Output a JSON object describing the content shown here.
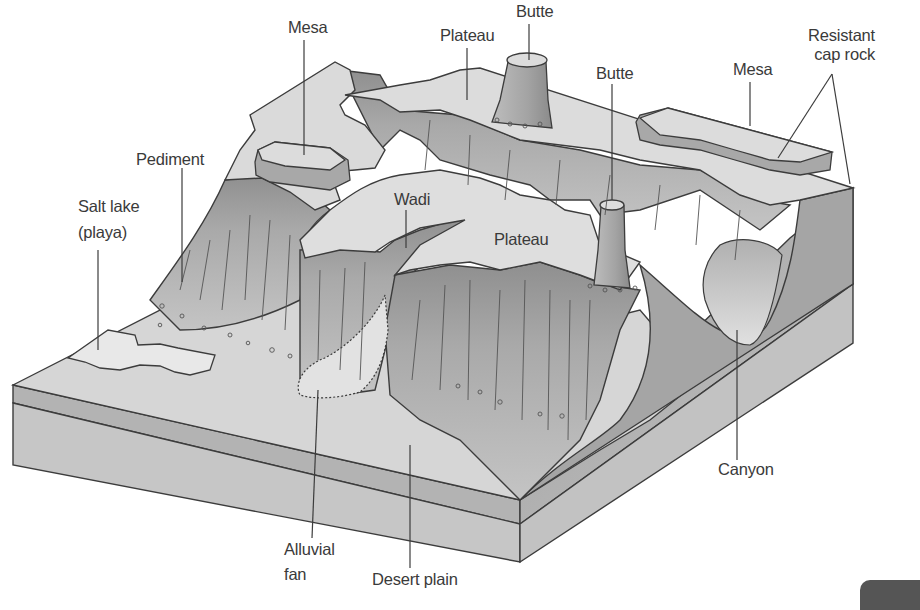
{
  "figure": {
    "labels": [
      {
        "id": "mesa-left",
        "text": "Mesa",
        "x": 288,
        "y": 18
      },
      {
        "id": "plateau-top",
        "text": "Plateau",
        "x": 440,
        "y": 26
      },
      {
        "id": "butte-top",
        "text": "Butte",
        "x": 516,
        "y": 2
      },
      {
        "id": "butte-right",
        "text": "Butte",
        "x": 596,
        "y": 64
      },
      {
        "id": "mesa-right",
        "text": "Mesa",
        "x": 733,
        "y": 60
      },
      {
        "id": "resistant-cap-rock",
        "text": "Resistant\ncap rock",
        "line1": "Resistant",
        "line2": "cap rock",
        "x": 808,
        "y": 26
      },
      {
        "id": "pediment",
        "text": "Pediment",
        "x": 136,
        "y": 150
      },
      {
        "id": "salt-lake",
        "text": "Salt lake\n(playa)",
        "line1": "Salt lake",
        "line2": "(playa)",
        "x": 78,
        "y": 197
      },
      {
        "id": "wadi",
        "text": "Wadi",
        "x": 394,
        "y": 190
      },
      {
        "id": "plateau-center",
        "text": "Plateau",
        "x": 494,
        "y": 230
      },
      {
        "id": "canyon",
        "text": "Canyon",
        "x": 718,
        "y": 460
      },
      {
        "id": "alluvial-fan",
        "text": "Alluvial\nfan",
        "line1": "Alluvial",
        "line2": "fan",
        "x": 284,
        "y": 540
      },
      {
        "id": "desert-plain",
        "text": "Desert plain",
        "x": 372,
        "y": 570
      }
    ]
  },
  "colors": {
    "background": "#ffffff",
    "line": "#3c3c3c",
    "label_text": "#3a3a3a",
    "top_surface": "#d9d9d9",
    "cliff_face": "#a8a8a8",
    "cliff_shadow": "#8e8e8e",
    "front_layer_top": "#b3b3b3",
    "front_layer_bottom": "#c6c6c6",
    "side_face": "#b8b8b8",
    "playa": "#e6e6e6",
    "fan": "#e2e2e2"
  }
}
